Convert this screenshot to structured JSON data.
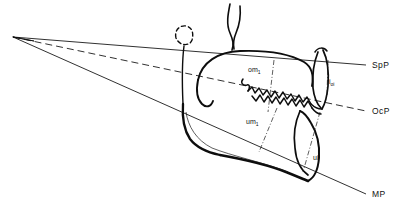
{
  "figure": {
    "name": "cephalometric-jaw-diagram",
    "title": "",
    "background_color": "#ffffff",
    "ink_color": "#111111"
  },
  "planes": [
    {
      "id": "spp",
      "label": "SpP",
      "style": "solid",
      "apex": {
        "x": 13,
        "y": 37
      },
      "end": {
        "x": 366,
        "y": 65
      },
      "label_pos": {
        "x": 372,
        "y": 68
      }
    },
    {
      "id": "ocp",
      "label": "OcP",
      "style": "dashed",
      "apex": {
        "x": 13,
        "y": 37
      },
      "end": {
        "x": 366,
        "y": 111
      },
      "label_pos": {
        "x": 372,
        "y": 114
      }
    },
    {
      "id": "mp",
      "label": "MP",
      "style": "solid",
      "apex": {
        "x": 13,
        "y": 37
      },
      "end": {
        "x": 366,
        "y": 194
      },
      "label_pos": {
        "x": 372,
        "y": 197
      }
    }
  ],
  "landmarks": [
    {
      "id": "om1",
      "label": "om",
      "subscript": "1",
      "label_pos": {
        "x": 248,
        "y": 72
      },
      "leader": {
        "x1": 274,
        "y1": 60,
        "x2": 268,
        "y2": 112
      }
    },
    {
      "id": "i-oi",
      "label": "i",
      "subscript": "oi",
      "label_pos": {
        "x": 329,
        "y": 84
      },
      "leader": {
        "x1": 328,
        "y1": 60,
        "x2": 327,
        "y2": 96
      }
    },
    {
      "id": "um1",
      "label": "um",
      "subscript": "1",
      "label_pos": {
        "x": 246,
        "y": 124
      },
      "leader": {
        "x1": 277,
        "y1": 108,
        "x2": 259,
        "y2": 152
      }
    },
    {
      "id": "ui",
      "label": "ui",
      "subscript": "",
      "label_pos": {
        "x": 313,
        "y": 160
      },
      "leader": {
        "x1": 320,
        "y1": 112,
        "x2": 303,
        "y2": 172
      }
    }
  ],
  "anatomy": {
    "maxilla": "upper-jaw-outline",
    "mandible": "lower-jaw-outline",
    "teeth_row": "occlusal-tooth-cusps",
    "incisors": "incisor-outline",
    "coronoid_fragment": "dashed-bone-fragment",
    "zygomatic_arch": "zygomatic-arch-curve",
    "ramus": "mandibular-ramus"
  }
}
